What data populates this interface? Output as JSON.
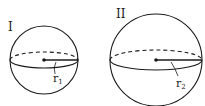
{
  "figures": [
    {
      "label": "I",
      "radius_label": "r",
      "radius_subscript": "1"
    },
    {
      "label": "II",
      "radius_label": "r",
      "radius_subscript": "2"
    }
  ],
  "colors": {
    "stroke": "#1a1a1a"
  }
}
